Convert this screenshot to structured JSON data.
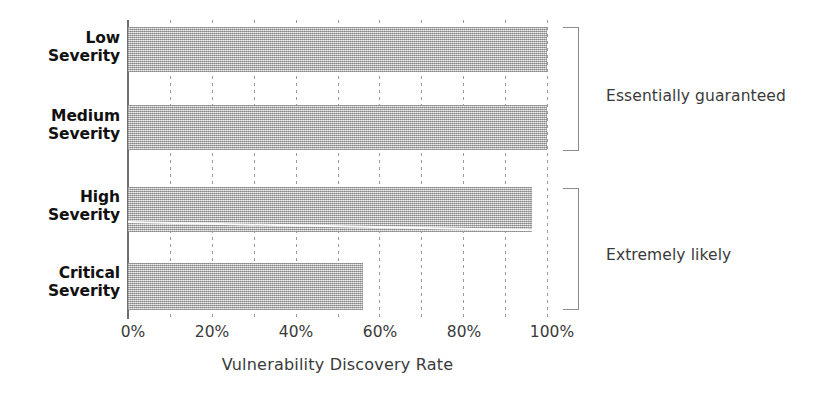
{
  "chart_data": {
    "type": "bar",
    "orientation": "horizontal",
    "title": "",
    "xlabel": "Vulnerability Discovery Rate",
    "ylabel": "",
    "categories": [
      "Low Severity",
      "Medium Severity",
      "High Severity",
      "Critical Severity"
    ],
    "values": [
      100,
      100,
      96.5,
      56
    ],
    "xlim": [
      0,
      100
    ],
    "xticks": [
      0,
      20,
      40,
      60,
      80,
      100
    ],
    "xticklabels": [
      "0%",
      "20%",
      "40%",
      "60%",
      "80%",
      "100%"
    ],
    "grid": true,
    "grid_axis": "x",
    "grid_style": "dashed",
    "grid_interval": 10,
    "legend": "none",
    "bar_color": "#bdbdbd",
    "annotations": [
      {
        "text": "Essentially guaranteed",
        "spans": [
          "Low Severity",
          "Medium Severity"
        ],
        "marker": "bracket"
      },
      {
        "text": "Extremely likely",
        "spans": [
          "High Severity",
          "Critical Severity"
        ],
        "marker": "bracket"
      }
    ]
  },
  "axis": {
    "x_title": "Vulnerability Discovery Rate",
    "ticks": [
      {
        "label": "0%",
        "value": 0
      },
      {
        "label": "20%",
        "value": 20
      },
      {
        "label": "40%",
        "value": 40
      },
      {
        "label": "60%",
        "value": 60
      },
      {
        "label": "80%",
        "value": 80
      },
      {
        "label": "100%",
        "value": 100
      }
    ]
  },
  "categories": [
    {
      "line1": "Low",
      "line2": "Severity",
      "value": 100
    },
    {
      "line1": "Medium",
      "line2": "Severity",
      "value": 100
    },
    {
      "line1": "High",
      "line2": "Severity",
      "value": 96.5
    },
    {
      "line1": "Critical",
      "line2": "Severity",
      "value": 56
    }
  ],
  "annotations": [
    {
      "text": "Essentially guaranteed"
    },
    {
      "text": "Extremely likely"
    }
  ],
  "colors": {
    "bar": "#bdbdbd",
    "grid": "#9a9a9a",
    "axis": "#6f6f6f",
    "text": "#3a3a3a",
    "label": "#111111",
    "bracket": "#8c8c8c"
  }
}
